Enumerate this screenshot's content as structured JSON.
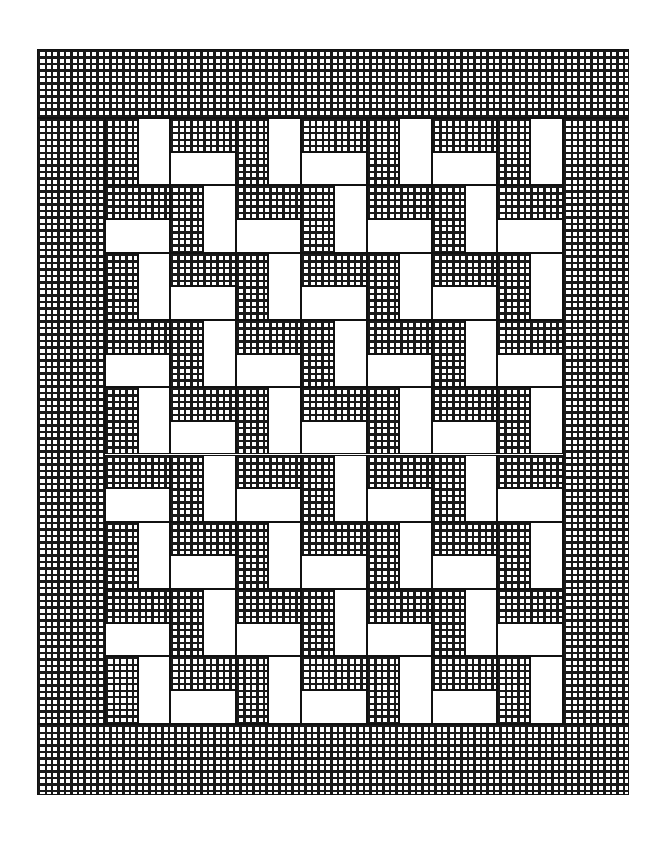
{
  "diagram": {
    "title": "",
    "colors": {
      "line": "#111111",
      "background": "#ffffff",
      "hatch": "#1a1a1a"
    },
    "frame": {
      "x": 37,
      "y": 49,
      "width": 592,
      "height": 746
    },
    "borders": {
      "top": {
        "label": "top-border",
        "x": 37,
        "y": 49,
        "width": 592,
        "height": 69
      },
      "bottom": {
        "label": "bottom-border",
        "x": 37,
        "y": 724,
        "width": 592,
        "height": 71
      },
      "left": {
        "label": "left-border",
        "x": 37,
        "y": 118,
        "width": 68,
        "height": 606
      },
      "right": {
        "label": "right-border",
        "x": 563,
        "y": 118,
        "width": 66,
        "height": 606
      }
    },
    "grid": {
      "x": 105,
      "y": 118,
      "cols": 7,
      "rows": 9,
      "block_width": 65.4,
      "block_height": 67.3,
      "block_types": {
        "A": {
          "description": "vertical split: hatched left half, white right half"
        },
        "B": {
          "description": "horizontal split: hatched top half, white bottom half"
        }
      },
      "layout": [
        [
          "A",
          "B",
          "A",
          "B",
          "A",
          "B",
          "A"
        ],
        [
          "B",
          "A",
          "B",
          "A",
          "B",
          "A",
          "B"
        ],
        [
          "A",
          "B",
          "A",
          "B",
          "A",
          "B",
          "A"
        ],
        [
          "B",
          "A",
          "B",
          "A",
          "B",
          "A",
          "B"
        ],
        [
          "A",
          "B",
          "A",
          "B",
          "A",
          "B",
          "A"
        ],
        [
          "B",
          "A",
          "B",
          "A",
          "B",
          "A",
          "B"
        ],
        [
          "A",
          "B",
          "A",
          "B",
          "A",
          "B",
          "A"
        ],
        [
          "B",
          "A",
          "B",
          "A",
          "B",
          "A",
          "B"
        ],
        [
          "A",
          "B",
          "A",
          "B",
          "A",
          "B",
          "A"
        ]
      ]
    }
  }
}
